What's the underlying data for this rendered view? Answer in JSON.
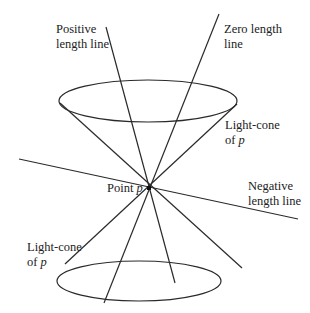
{
  "diagram": {
    "labels": {
      "positive_line_1": "Positive",
      "positive_line_2": "length line",
      "zero_line_1": "Zero length",
      "zero_line_2": "line",
      "upper_cone_1": "Light-cone",
      "upper_cone_2_prefix": "of ",
      "upper_cone_2_var": "p",
      "point_prefix": "Point ",
      "point_var": "p",
      "negative_line_1": "Negative",
      "negative_line_2": "length line",
      "lower_cone_1": "Light-cone",
      "lower_cone_2_prefix": "of ",
      "lower_cone_2_var": "p"
    },
    "colors": {
      "stroke": "#2a2a2a",
      "text": "#222222",
      "background": "#ffffff"
    }
  }
}
